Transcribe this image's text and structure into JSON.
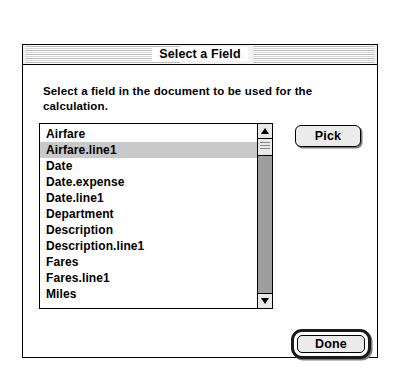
{
  "window": {
    "title": "Select a Field"
  },
  "instructions": {
    "text": "Select a field in the document to be used for the calculation."
  },
  "field_list": {
    "items": [
      {
        "label": "Airfare",
        "selected": false
      },
      {
        "label": "Airfare.line1",
        "selected": true
      },
      {
        "label": "Date",
        "selected": false
      },
      {
        "label": "Date.expense",
        "selected": false
      },
      {
        "label": "Date.line1",
        "selected": false
      },
      {
        "label": "Department",
        "selected": false
      },
      {
        "label": "Description",
        "selected": false
      },
      {
        "label": "Description.line1",
        "selected": false
      },
      {
        "label": "Fares",
        "selected": false
      },
      {
        "label": "Fares.line1",
        "selected": false
      },
      {
        "label": "Miles",
        "selected": false
      }
    ],
    "selected_value": "Airfare.line1"
  },
  "scrollbar": {
    "up_arrow_icon": "triangle-up-icon",
    "down_arrow_icon": "triangle-down-icon"
  },
  "buttons": {
    "pick_label": "Pick",
    "done_label": "Done"
  },
  "colors": {
    "window_background": "#ffffff",
    "selection": "#c9c9c9",
    "button_face": "#ebebeb",
    "scrollbar_track": "#9e9e9e",
    "border": "#000000"
  }
}
